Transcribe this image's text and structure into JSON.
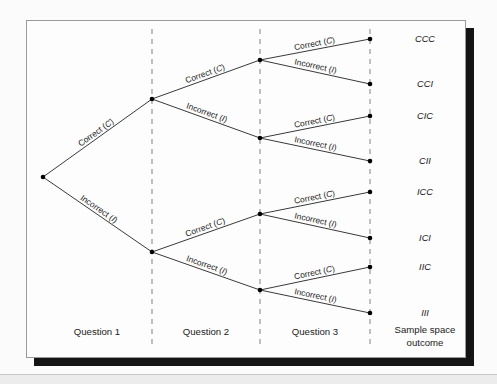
{
  "figure": {
    "type": "probability-tree-diagram",
    "columns": [
      {
        "id": "q1",
        "label": "Question 1",
        "x": 97
      },
      {
        "id": "q2",
        "label": "Question 2",
        "x": 206
      },
      {
        "id": "q3",
        "label": "Question 3",
        "x": 315
      },
      {
        "id": "outcome",
        "label_line1": "Sample space",
        "label_line2": "outcome",
        "x": 425
      }
    ],
    "dividers_x": [
      152,
      260,
      370
    ],
    "branch_labels": {
      "correct": "Correct (",
      "correct_symbol": "C",
      "correct_close": ")",
      "incorrect": "Incorrect (",
      "incorrect_symbol": "I",
      "incorrect_close": ")"
    },
    "nodes": [
      {
        "id": "root",
        "x": 43,
        "y": 177,
        "level": 0
      },
      {
        "id": "C",
        "x": 152,
        "y": 99,
        "level": 1
      },
      {
        "id": "I",
        "x": 152,
        "y": 252,
        "level": 1
      },
      {
        "id": "CC",
        "x": 260,
        "y": 60,
        "level": 2
      },
      {
        "id": "CI",
        "x": 260,
        "y": 138,
        "level": 2
      },
      {
        "id": "IC",
        "x": 260,
        "y": 214,
        "level": 2
      },
      {
        "id": "II",
        "x": 260,
        "y": 290,
        "level": 2
      },
      {
        "id": "CCC",
        "x": 370,
        "y": 39,
        "level": 3
      },
      {
        "id": "CCI",
        "x": 370,
        "y": 84,
        "level": 3
      },
      {
        "id": "CIC",
        "x": 370,
        "y": 116,
        "level": 3
      },
      {
        "id": "CII",
        "x": 370,
        "y": 161,
        "level": 3
      },
      {
        "id": "ICC",
        "x": 370,
        "y": 192,
        "level": 3
      },
      {
        "id": "ICI",
        "x": 370,
        "y": 238,
        "level": 3
      },
      {
        "id": "IIC",
        "x": 370,
        "y": 267,
        "level": 3
      },
      {
        "id": "III",
        "x": 370,
        "y": 313,
        "level": 3
      }
    ],
    "edges": [
      {
        "from": "root",
        "to": "C",
        "label": "correct"
      },
      {
        "from": "root",
        "to": "I",
        "label": "incorrect"
      },
      {
        "from": "C",
        "to": "CC",
        "label": "correct"
      },
      {
        "from": "C",
        "to": "CI",
        "label": "incorrect"
      },
      {
        "from": "I",
        "to": "IC",
        "label": "correct"
      },
      {
        "from": "I",
        "to": "II",
        "label": "incorrect"
      },
      {
        "from": "CC",
        "to": "CCC",
        "label": "correct"
      },
      {
        "from": "CC",
        "to": "CCI",
        "label": "incorrect"
      },
      {
        "from": "CI",
        "to": "CIC",
        "label": "correct"
      },
      {
        "from": "CI",
        "to": "CII",
        "label": "incorrect"
      },
      {
        "from": "IC",
        "to": "ICC",
        "label": "correct"
      },
      {
        "from": "IC",
        "to": "ICI",
        "label": "incorrect"
      },
      {
        "from": "II",
        "to": "IIC",
        "label": "correct"
      },
      {
        "from": "II",
        "to": "III",
        "label": "incorrect"
      }
    ],
    "outcomes": [
      {
        "text": "CCC",
        "x": 425,
        "y": 42
      },
      {
        "text": "CCI",
        "x": 425,
        "y": 87
      },
      {
        "text": "CIC",
        "x": 425,
        "y": 119
      },
      {
        "text": "CII",
        "x": 425,
        "y": 164
      },
      {
        "text": "ICC",
        "x": 425,
        "y": 195
      },
      {
        "text": "ICI",
        "x": 425,
        "y": 241
      },
      {
        "text": "IIC",
        "x": 425,
        "y": 270
      },
      {
        "text": "III",
        "x": 425,
        "y": 316
      }
    ],
    "colors": {
      "card_background": "#fdfdfd",
      "card_border": "#9a9a9a",
      "shadow": "#141414",
      "edge": "#3a3a3a",
      "divider": "#8c8c8c",
      "node": "#000000",
      "text": "#1a1a1a",
      "page_background": "#fbfbfb"
    },
    "column_label_y": 335,
    "outcome_label_y1": 333,
    "outcome_label_y2": 346
  }
}
